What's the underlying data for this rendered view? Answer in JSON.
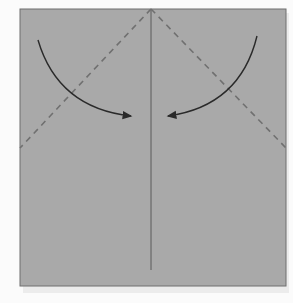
{
  "diagram": {
    "type": "origami-fold-step",
    "paper": {
      "x": 20,
      "y": 9,
      "width": 266,
      "height": 277,
      "fill": "#a9a9a9",
      "edge": "#6f6f6f"
    },
    "center_crease": {
      "x": 151,
      "y1": 9,
      "y2": 270,
      "color": "#5a5a5a"
    },
    "valley_folds": [
      {
        "name": "left-diagonal",
        "x1": 151,
        "y1": 9,
        "x2": 20,
        "y2": 148
      },
      {
        "name": "right-diagonal",
        "x1": 151,
        "y1": 9,
        "x2": 286,
        "y2": 148
      }
    ],
    "arrows": [
      {
        "name": "left-fold-arrow",
        "path": "M38 40 Q58 108 131 116"
      },
      {
        "name": "right-fold-arrow",
        "path": "M257 36 Q240 106 168 116"
      }
    ],
    "colors": {
      "background": "#fbfbfb",
      "dash": "#707070",
      "arrow": "#2a2a2a"
    }
  }
}
